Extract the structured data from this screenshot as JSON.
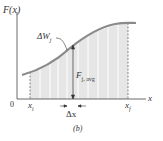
{
  "figure": {
    "caption": "(b)",
    "y_axis_label": "F(x)",
    "x_axis_label": "x",
    "origin_label": "0",
    "xi_label": "x",
    "xi_sub": "i",
    "xf_label": "x",
    "xf_sub": "f",
    "delta_w_label": "ΔW",
    "delta_w_sub": "j",
    "f_avg_label": "F",
    "f_avg_sub": "j, avg",
    "delta_x_label": "Δx"
  },
  "colors": {
    "curve": "#8a8a8a",
    "fill": "#e6e6e6",
    "strip_lines": "#ffffff",
    "axis": "#444444",
    "text": "#333333"
  }
}
